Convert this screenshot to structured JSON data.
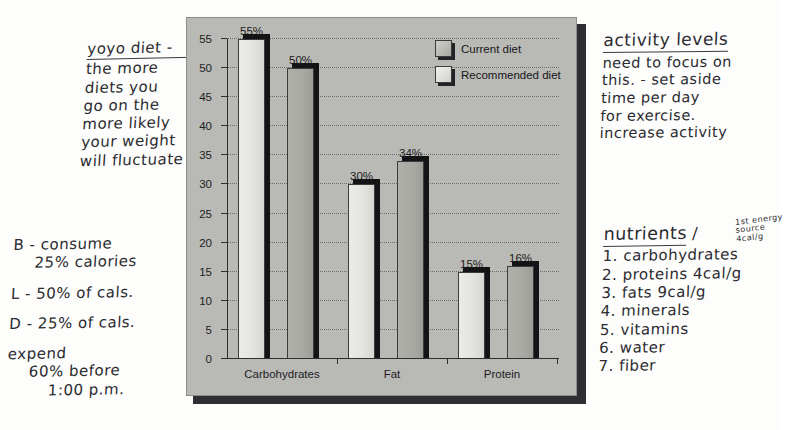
{
  "chart_data": {
    "type": "bar",
    "title": "",
    "categories": [
      "Carbohydrates",
      "Fat",
      "Protein"
    ],
    "series": [
      {
        "name": "Current diet",
        "values": [
          55,
          30,
          15
        ],
        "labels": [
          "55%",
          "30%",
          "15%"
        ]
      },
      {
        "name": "Recommended diet",
        "values": [
          50,
          34,
          16
        ],
        "labels": [
          "50%",
          "34%",
          "16%"
        ]
      }
    ],
    "xlabel": "",
    "ylabel": "",
    "ylim": [
      0,
      55
    ],
    "yticks": [
      0,
      5,
      10,
      15,
      20,
      25,
      30,
      35,
      40,
      45,
      50,
      55
    ],
    "ytick_labels": [
      "0",
      "5",
      "10",
      "15",
      "20",
      "25",
      "30",
      "35",
      "40",
      "45",
      "50",
      "55"
    ],
    "grid": true,
    "legend_position": "top-right",
    "colors": {
      "current": "#e3e3df",
      "recommended": "#a9a9a4",
      "shadow": "#141416",
      "card_background": "#b9b9b5"
    }
  },
  "legend": {
    "entries": [
      {
        "label": "Current diet",
        "swatch": "current"
      },
      {
        "label": "Recommended diet",
        "swatch": "recommended"
      }
    ]
  },
  "notes": {
    "yoyo": {
      "lines": [
        "yoyo diet -",
        "the more",
        "diets you",
        "go on the",
        "more likely",
        "your weight",
        "will fluctuate"
      ]
    },
    "meals": {
      "lines": [
        "B - consume",
        "25% calories",
        "L - 50% of cals.",
        "D - 25% of cals.",
        "expend",
        "60% before",
        "1:00 p.m."
      ]
    },
    "activity": {
      "heading": "activity levels",
      "lines": [
        "need to focus on",
        "this. - set aside",
        "time per day",
        "for exercise.",
        "increase activity"
      ]
    },
    "nutrients": {
      "heading": "nutrients",
      "slash": "/",
      "margin_note": "1st energy source 4cal/g",
      "items": [
        "1. carbohydrates",
        "2. proteins 4cal/g",
        "3. fats 9cal/g",
        "4. minerals",
        "5. vitamins",
        "6. water",
        "7. fiber"
      ]
    }
  }
}
